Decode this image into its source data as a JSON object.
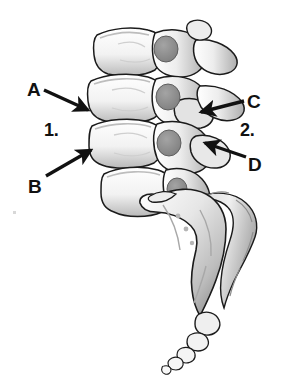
{
  "figure": {
    "background_color": "#ffffff",
    "ink_color": "#111111",
    "bone_fill_light": "#f7f7f7",
    "bone_fill_mid": "#d9d9d9",
    "bone_fill_dark": "#9a9a9a",
    "disc_fill": "#8c8c8c",
    "width": 286,
    "height": 377
  },
  "labels": {
    "a": "A",
    "b": "B",
    "c": "C",
    "d": "D",
    "one": "1.",
    "two": "2."
  },
  "annotations": [
    {
      "id": "a",
      "text": "A",
      "label_x": 27,
      "label_y": 80,
      "arrow_from": [
        44,
        90
      ],
      "arrow_to": [
        90,
        111
      ],
      "points_at": "superior-vertebral-endplate"
    },
    {
      "id": "b",
      "text": "B",
      "label_x": 28,
      "label_y": 177,
      "arrow_from": [
        46,
        176
      ],
      "arrow_to": [
        93,
        149
      ],
      "points_at": "inferior-vertebral-endplate"
    },
    {
      "id": "c",
      "text": "C",
      "label_x": 247,
      "label_y": 92,
      "arrow_from": [
        244,
        101
      ],
      "arrow_to": [
        199,
        113
      ],
      "points_at": "superior-articular-facet"
    },
    {
      "id": "d",
      "text": "D",
      "label_x": 248,
      "label_y": 155,
      "arrow_from": [
        246,
        157
      ],
      "arrow_to": [
        203,
        142
      ],
      "points_at": "inferior-articular-facet"
    },
    {
      "id": "one",
      "text": "1.",
      "label_x": 44,
      "label_y": 121,
      "arrow_from": null,
      "arrow_to": null,
      "points_at": "vertebral-body"
    },
    {
      "id": "two",
      "text": "2.",
      "label_x": 240,
      "label_y": 121,
      "arrow_from": null,
      "arrow_to": null,
      "points_at": "posterior-vertebral-arch"
    }
  ]
}
